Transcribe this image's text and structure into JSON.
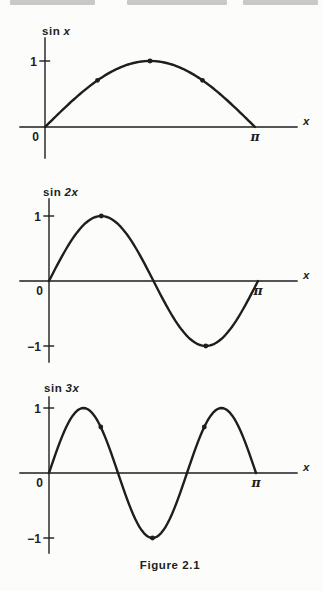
{
  "figure": {
    "caption": "Figure 2.1"
  },
  "colors": {
    "ink": "#1e1e1e",
    "paper": "#fcfcfa"
  },
  "chart_data": [
    {
      "id": "sin-x",
      "type": "line",
      "title_fn": "sin",
      "title_arg": "x",
      "function": "y = sin(x)",
      "k": 1,
      "x_range": [
        0,
        3.14159
      ],
      "ylim": [
        -0.5,
        1.4
      ],
      "grid": false,
      "legend": false,
      "xlabel": "x",
      "x_tick_labels": {
        "origin": "0",
        "end": "π"
      },
      "y_ticks": [
        {
          "value": 1,
          "label": "1"
        }
      ],
      "marked_points": [
        {
          "x_pi": 0.25,
          "y": 0.707
        },
        {
          "x_pi": 0.5,
          "y": 1
        },
        {
          "x_pi": 0.75,
          "y": 0.707
        }
      ]
    },
    {
      "id": "sin-2x",
      "type": "line",
      "title_fn": "sin",
      "title_arg": "2x",
      "function": "y = sin(2x)",
      "k": 2,
      "x_range": [
        0,
        3.14159
      ],
      "ylim": [
        -1.3,
        1.3
      ],
      "grid": false,
      "legend": false,
      "xlabel": "x",
      "x_tick_labels": {
        "origin": "0",
        "end": "π"
      },
      "y_ticks": [
        {
          "value": 1,
          "label": "1"
        },
        {
          "value": -1,
          "label": "−1"
        }
      ],
      "marked_points": [
        {
          "x_pi": 0.25,
          "y": 1
        },
        {
          "x_pi": 0.75,
          "y": -1
        }
      ]
    },
    {
      "id": "sin-3x",
      "type": "line",
      "title_fn": "sin",
      "title_arg": "3x",
      "function": "y = sin(3x)",
      "k": 3,
      "x_range": [
        0,
        3.14159
      ],
      "ylim": [
        -1.3,
        1.3
      ],
      "grid": false,
      "legend": false,
      "xlabel": "x",
      "x_tick_labels": {
        "origin": "0",
        "end": "π"
      },
      "y_ticks": [
        {
          "value": 1,
          "label": "1"
        },
        {
          "value": -1,
          "label": "−1"
        }
      ],
      "marked_points": [
        {
          "x_pi": 0.25,
          "y": 0.707
        },
        {
          "x_pi": 0.5,
          "y": -1
        },
        {
          "x_pi": 0.75,
          "y": 0.707
        }
      ]
    }
  ]
}
